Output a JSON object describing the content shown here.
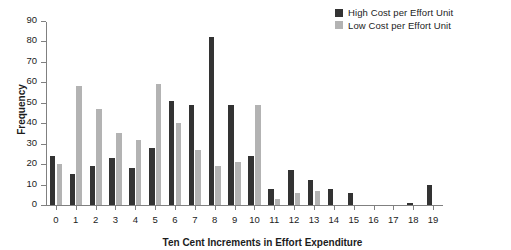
{
  "chart_data": {
    "type": "bar",
    "title": "",
    "xlabel": "Ten Cent Increments in Effort Expenditure",
    "ylabel": "Frequency",
    "categories": [
      "0",
      "1",
      "2",
      "3",
      "4",
      "5",
      "6",
      "7",
      "8",
      "9",
      "10",
      "11",
      "12",
      "13",
      "14",
      "15",
      "16",
      "17",
      "18",
      "19"
    ],
    "series": [
      {
        "name": "High Cost per Effort Unit",
        "color": "#333333",
        "values": [
          24,
          15,
          19,
          23,
          18,
          28,
          51,
          49,
          82,
          49,
          24,
          8,
          17,
          12,
          8,
          6,
          0,
          0,
          1,
          10
        ]
      },
      {
        "name": "Low Cost per Effort Unit",
        "color": "#b3b3b3",
        "values": [
          20,
          58,
          47,
          35,
          32,
          59,
          40,
          27,
          19,
          21,
          49,
          3,
          6,
          7,
          0,
          0,
          0,
          0,
          0,
          0
        ]
      }
    ],
    "ylim": [
      0,
      90
    ],
    "yticks": [
      0,
      10,
      20,
      30,
      40,
      50,
      60,
      70,
      80,
      90
    ],
    "grid": false,
    "legend_position": "top-right"
  },
  "legend": {
    "entries": [
      {
        "label": "High Cost per Effort Unit",
        "color": "#333333"
      },
      {
        "label": "Low Cost per Effort Unit",
        "color": "#b3b3b3"
      }
    ]
  }
}
